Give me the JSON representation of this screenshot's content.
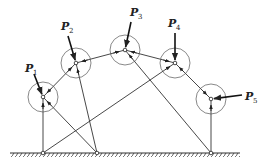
{
  "diagram": {
    "title": "",
    "stroke_color": "#333333",
    "nodes": [
      {
        "id": "N1",
        "x": 43,
        "y": 97,
        "r": 15,
        "load": {
          "label": "P",
          "sub": "1",
          "from": [
            34,
            74
          ],
          "label_xy": [
            25,
            72
          ]
        }
      },
      {
        "id": "N2",
        "x": 76,
        "y": 63,
        "r": 15,
        "load": {
          "label": "P",
          "sub": "2",
          "from": [
            68,
            36
          ],
          "label_xy": [
            61,
            30
          ]
        }
      },
      {
        "id": "N3",
        "x": 125,
        "y": 50,
        "r": 15,
        "load": {
          "label": "P",
          "sub": "3",
          "from": [
            131,
            22
          ],
          "label_xy": [
            130,
            16
          ]
        }
      },
      {
        "id": "N4",
        "x": 175,
        "y": 63,
        "r": 15,
        "load": {
          "label": "P",
          "sub": "4",
          "from": [
            175,
            33
          ],
          "label_xy": [
            168,
            27
          ]
        }
      },
      {
        "id": "N5",
        "x": 211,
        "y": 99,
        "r": 15,
        "load": {
          "label": "P",
          "sub": "5",
          "from": [
            242,
            95
          ],
          "label_xy": [
            245,
            100
          ]
        }
      }
    ],
    "supports": [
      {
        "id": "A",
        "x": 43,
        "y": 153
      },
      {
        "id": "B",
        "x": 97,
        "y": 153
      },
      {
        "id": "C",
        "x": 211,
        "y": 153
      }
    ],
    "members": [
      [
        "N1",
        "N2"
      ],
      [
        "N2",
        "N3"
      ],
      [
        "N3",
        "N4"
      ],
      [
        "N4",
        "N5"
      ],
      [
        "N1",
        "A"
      ],
      [
        "N1",
        "B"
      ],
      [
        "N2",
        "B"
      ],
      [
        "A",
        "N4"
      ],
      [
        "N3",
        "C"
      ],
      [
        "N5",
        "C"
      ]
    ],
    "ground": {
      "x1": 10,
      "x2": 240,
      "y": 153
    }
  }
}
